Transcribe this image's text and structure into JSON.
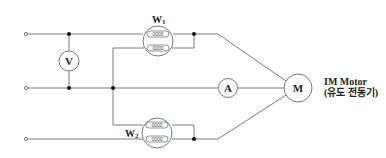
{
  "diagram": {
    "meters": {
      "voltmeter": "V",
      "ammeter": "A",
      "wattmeter1": "W",
      "wattmeter1_sub": "1",
      "wattmeter2": "W",
      "wattmeter2_sub": "2",
      "motor": "M"
    },
    "coil_label": "0000",
    "motor_caption": {
      "line1": "IM Motor",
      "line2": "(유도 전동기)"
    }
  }
}
